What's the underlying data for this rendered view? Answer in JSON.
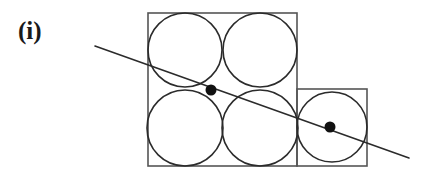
{
  "figure": {
    "label": "(i)",
    "caption_text": "(i)",
    "background_color": "#ffffff",
    "stroke_color": "#2b2b2b",
    "square_stroke_color": "#555555",
    "dot_color": "#111111",
    "width": 429,
    "height": 180
  },
  "geometry": {
    "large_square": {
      "name": "large-square",
      "x": 148,
      "y": 13,
      "width": 149,
      "height": 153,
      "stroke_width": 1.6
    },
    "small_square": {
      "name": "small-square",
      "x": 297,
      "y": 89,
      "width": 70,
      "height": 77,
      "stroke_width": 1.6
    },
    "circles": [
      {
        "name": "circle-top-left",
        "cx": 185,
        "cy": 50,
        "r": 37,
        "stroke_width": 1.6
      },
      {
        "name": "circle-top-right",
        "cx": 260,
        "cy": 50,
        "r": 37,
        "stroke_width": 1.6
      },
      {
        "name": "circle-bottom-left",
        "cx": 185,
        "cy": 128,
        "r": 38,
        "stroke_width": 1.6
      },
      {
        "name": "circle-bottom-right",
        "cx": 260,
        "cy": 128,
        "r": 38,
        "stroke_width": 1.6
      },
      {
        "name": "circle-small-square",
        "cx": 332,
        "cy": 127,
        "r": 35,
        "stroke_width": 1.6
      }
    ],
    "line": {
      "name": "secant-line",
      "x1": 95,
      "y1": 46,
      "x2": 409,
      "y2": 158,
      "stroke_width": 1.6
    },
    "points": [
      {
        "name": "tangency-point-upper",
        "cx": 211,
        "cy": 90,
        "r": 5.5
      },
      {
        "name": "tangency-point-lower",
        "cx": 330,
        "cy": 127,
        "r": 5.5
      }
    ]
  }
}
